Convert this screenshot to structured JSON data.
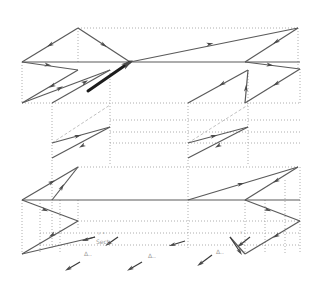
{
  "diagram": {
    "title": "",
    "colors": {
      "solid_line": "#5a5a5a",
      "thick_arrow": "#1c1c1c",
      "guide_line": "#9a9a9a",
      "background": "#ffffff"
    },
    "solid_segments": [
      [
        22,
        62,
        78,
        28
      ],
      [
        78,
        28,
        130,
        62
      ],
      [
        22,
        62,
        300,
        62
      ],
      [
        130,
        62,
        298,
        28
      ],
      [
        298,
        28,
        245,
        62
      ],
      [
        245,
        62,
        300,
        69
      ],
      [
        22,
        62,
        78,
        70
      ],
      [
        78,
        70,
        22,
        103
      ],
      [
        22,
        103,
        110,
        70
      ],
      [
        52,
        103,
        110,
        70
      ],
      [
        300,
        69,
        245,
        103
      ],
      [
        245,
        103,
        248,
        70
      ],
      [
        188,
        103,
        248,
        70
      ],
      [
        52,
        143,
        110,
        127
      ],
      [
        52,
        158,
        110,
        127
      ],
      [
        188,
        143,
        248,
        127
      ],
      [
        188,
        158,
        248,
        127
      ],
      [
        22,
        200,
        78,
        167
      ],
      [
        78,
        167,
        52,
        200
      ],
      [
        22,
        200,
        300,
        200
      ],
      [
        188,
        200,
        298,
        167
      ],
      [
        298,
        167,
        245,
        200
      ],
      [
        22,
        200,
        78,
        221
      ],
      [
        78,
        221,
        22,
        254
      ],
      [
        22,
        254,
        95,
        237
      ],
      [
        245,
        200,
        300,
        221
      ],
      [
        300,
        221,
        245,
        254
      ],
      [
        245,
        254,
        230,
        237
      ]
    ],
    "thick_arrows": [
      [
        88,
        91,
        130,
        62
      ]
    ],
    "dotted_guides": [
      [
        78,
        28,
        298,
        28
      ],
      [
        298,
        28,
        298,
        69
      ],
      [
        78,
        28,
        78,
        62
      ],
      [
        22,
        62,
        22,
        103
      ],
      [
        22,
        103,
        300,
        103
      ],
      [
        300,
        69,
        300,
        103
      ],
      [
        110,
        70,
        110,
        165
      ],
      [
        52,
        103,
        52,
        250
      ],
      [
        248,
        70,
        248,
        165
      ],
      [
        188,
        103,
        188,
        250
      ],
      [
        110,
        120,
        300,
        120
      ],
      [
        110,
        132,
        300,
        132
      ],
      [
        110,
        143,
        300,
        143
      ],
      [
        22,
        200,
        22,
        254
      ],
      [
        300,
        167,
        300,
        254
      ],
      [
        78,
        167,
        300,
        167
      ],
      [
        40,
        200,
        40,
        254
      ],
      [
        60,
        200,
        60,
        254
      ],
      [
        78,
        200,
        78,
        230
      ],
      [
        245,
        200,
        245,
        254
      ],
      [
        265,
        200,
        265,
        254
      ],
      [
        285,
        180,
        285,
        254
      ],
      [
        78,
        221,
        300,
        221
      ],
      [
        40,
        233,
        300,
        233
      ],
      [
        40,
        245,
        300,
        245
      ]
    ],
    "dashed_guides": [
      [
        52,
        143,
        110,
        105
      ],
      [
        188,
        143,
        248,
        105
      ]
    ],
    "arrow_markers": [
      {
        "x": 50,
        "y": 45,
        "angle": 150
      },
      {
        "x": 104,
        "y": 45,
        "angle": 33
      },
      {
        "x": 48,
        "y": 65,
        "angle": 8
      },
      {
        "x": 52,
        "y": 86,
        "angle": 150
      },
      {
        "x": 60,
        "y": 88,
        "angle": -30
      },
      {
        "x": 85,
        "y": 82,
        "angle": -30
      },
      {
        "x": 210,
        "y": 44,
        "angle": -12
      },
      {
        "x": 276,
        "y": 42,
        "angle": 148
      },
      {
        "x": 270,
        "y": 65,
        "angle": 8
      },
      {
        "x": 222,
        "y": 84,
        "angle": 150
      },
      {
        "x": 276,
        "y": 84,
        "angle": 150
      },
      {
        "x": 246,
        "y": 88,
        "angle": -88
      },
      {
        "x": 78,
        "y": 136,
        "angle": -15
      },
      {
        "x": 82,
        "y": 146,
        "angle": 150
      },
      {
        "x": 214,
        "y": 136,
        "angle": -15
      },
      {
        "x": 218,
        "y": 146,
        "angle": 150
      },
      {
        "x": 52,
        "y": 182,
        "angle": -30
      },
      {
        "x": 62,
        "y": 187,
        "angle": -60
      },
      {
        "x": 45,
        "y": 210,
        "angle": 22
      },
      {
        "x": 52,
        "y": 235,
        "angle": 150
      },
      {
        "x": 241,
        "y": 184,
        "angle": -15
      },
      {
        "x": 276,
        "y": 181,
        "angle": 150
      },
      {
        "x": 268,
        "y": 210,
        "angle": 22
      },
      {
        "x": 276,
        "y": 236,
        "angle": 150
      }
    ],
    "small_vectors": [
      [
        95,
        237,
        85,
        240
      ],
      [
        118,
        237,
        108,
        244
      ],
      [
        80,
        262,
        68,
        269
      ],
      [
        142,
        262,
        130,
        269
      ],
      [
        185,
        241,
        172,
        245
      ],
      [
        212,
        255,
        200,
        264
      ],
      [
        230,
        237,
        240,
        252
      ],
      [
        250,
        237,
        240,
        245
      ]
    ],
    "annotations": [
      {
        "x": 96,
        "y": 244,
        "text": "Sect.."
      },
      {
        "x": 84,
        "y": 256,
        "text": "Δ.."
      },
      {
        "x": 148,
        "y": 258,
        "text": "Δ.."
      },
      {
        "x": 216,
        "y": 254,
        "text": "Δ.."
      },
      {
        "x": 98,
        "y": 236,
        "text": "ʸ ˣ"
      },
      {
        "x": 240,
        "y": 235,
        "text": "ʸ"
      }
    ]
  }
}
